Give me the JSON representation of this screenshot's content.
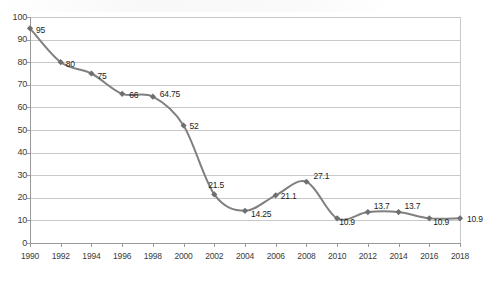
{
  "chart_data": {
    "type": "line",
    "title": "",
    "subtitle": "",
    "xlabel": "",
    "ylabel": "",
    "categories": [
      1990,
      1992,
      1994,
      1996,
      1998,
      2000,
      2002,
      2004,
      2006,
      2008,
      2010,
      2012,
      2014,
      2016,
      2018
    ],
    "values": [
      95,
      80,
      75,
      66,
      64.75,
      52,
      21.5,
      14.25,
      21.1,
      27.1,
      10.9,
      13.7,
      13.7,
      10.9,
      10.9
    ],
    "point_labels": [
      "95",
      "80",
      "75",
      "66",
      "64.75",
      "52",
      "21.5",
      "14.25",
      "21.1",
      "27.1",
      "10.9",
      "13.7",
      "13.7",
      "10.9",
      "10.9"
    ],
    "xtick_labels": [
      "1990",
      "1992",
      "1994",
      "1996",
      "1998",
      "2000",
      "2002",
      "2004",
      "2006",
      "2008",
      "2010",
      "2012",
      "2014",
      "2016",
      "2018"
    ],
    "ytick_labels": [
      "0",
      "10",
      "20",
      "30",
      "40",
      "50",
      "60",
      "70",
      "80",
      "90",
      "100"
    ],
    "ytick_values": [
      0,
      10,
      20,
      30,
      40,
      50,
      60,
      70,
      80,
      90,
      100
    ],
    "ylim": [
      0,
      100
    ],
    "xlim": [
      1990,
      2018
    ],
    "grid": "horizontal",
    "legend": "none",
    "series_color": "#808080",
    "marker": "diamond",
    "marker_color": "#6f6f6f",
    "grid_color": "#c9c9c9",
    "axis_color": "#9a9a9a",
    "label_color": "#1d1d1d"
  }
}
